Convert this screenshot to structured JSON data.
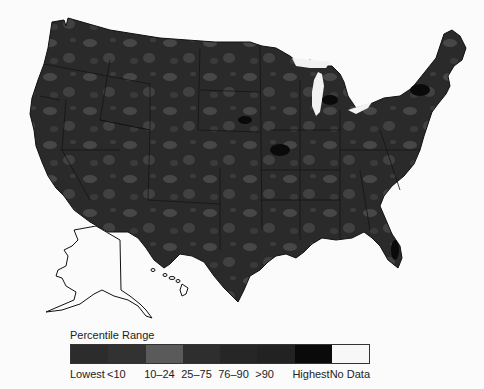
{
  "map": {
    "title": "",
    "regions": [
      "Contiguous United States",
      "Alaska",
      "Hawaii"
    ],
    "base_color": "#2a2a2a",
    "patch_color": "#4a4a4a",
    "hotspot_color": "#0d0d0d",
    "border_color": "#111111"
  },
  "legend": {
    "title": "Percentile Range",
    "items": [
      {
        "label": "Lowest",
        "color": "#2c2c2c"
      },
      {
        "label": "<10",
        "color": "#323232"
      },
      {
        "label": "10–24",
        "color": "#5a5a5a"
      },
      {
        "label": "25–75",
        "color": "#2e2e2e"
      },
      {
        "label": "76–90",
        "color": "#262626"
      },
      {
        "label": ">90",
        "color": "#222222"
      },
      {
        "label": "Highest",
        "color": "#0a0a0a"
      },
      {
        "label": "No Data",
        "color": "#f7f7f7"
      }
    ]
  }
}
